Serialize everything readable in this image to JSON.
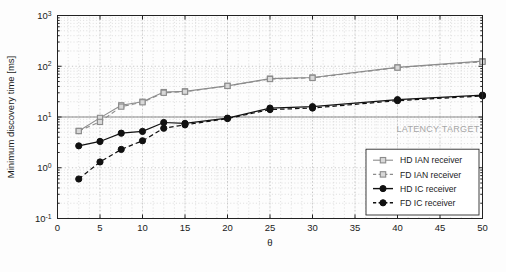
{
  "figure": {
    "background_color": "#fdfdfd",
    "latency_target_label": "LATENCY TARGET",
    "latency_target_value": 10,
    "latency_target_color": "#a6a6a6"
  },
  "chart_data": {
    "type": "line",
    "title": "",
    "xlabel": "θ",
    "ylabel": "Minimum discovery time [ms]",
    "xlim": [
      0,
      50
    ],
    "ylim": [
      0.1,
      1000
    ],
    "yscale": "log",
    "xscale": "linear",
    "grid": true,
    "grid_minor": true,
    "legend_position": "lower right",
    "x_ticks": [
      0,
      5,
      10,
      15,
      20,
      25,
      30,
      35,
      40,
      45,
      50
    ],
    "x_tick_labels": [
      "0",
      "5",
      "10",
      "15",
      "20",
      "25",
      "30",
      "35",
      "40",
      "45",
      "50"
    ],
    "y_ticks": [
      0.1,
      1,
      10,
      100,
      1000
    ],
    "y_tick_labels": [
      "10-1",
      "100",
      "101",
      "102",
      "103"
    ],
    "y_tick_mantissa": [
      "10",
      "10",
      "10",
      "10",
      "10"
    ],
    "y_tick_exponents": [
      "-1",
      "0",
      "1",
      "2",
      "3"
    ],
    "x": [
      2.5,
      5,
      7.5,
      10,
      12.5,
      15,
      20,
      25,
      30,
      40,
      50
    ],
    "series": [
      {
        "name": "HD IAN receiver",
        "color": "#8c8c8c",
        "marker": "square",
        "linestyle": "solid",
        "values": [
          5.3,
          9.6,
          17.0,
          20.0,
          31.0,
          32.0,
          41.0,
          57.0,
          60.0,
          95.0,
          126.0
        ]
      },
      {
        "name": "FD IAN receiver",
        "color": "#8c8c8c",
        "marker": "square",
        "linestyle": "dashed",
        "values": [
          5.3,
          8.0,
          16.0,
          19.5,
          30.0,
          31.5,
          41.0,
          56.0,
          59.0,
          94.0,
          122.0
        ]
      },
      {
        "name": "HD IC receiver",
        "color": "#111111",
        "marker": "circle",
        "linestyle": "solid",
        "values": [
          2.7,
          3.3,
          4.8,
          5.2,
          7.8,
          7.5,
          9.5,
          15.0,
          16.0,
          22.0,
          27.0
        ]
      },
      {
        "name": "FD IC receiver",
        "color": "#111111",
        "marker": "circle",
        "linestyle": "dashed",
        "values": [
          0.6,
          1.3,
          2.3,
          3.4,
          6.0,
          7.0,
          9.3,
          14.0,
          15.0,
          21.0,
          26.0
        ]
      }
    ]
  },
  "legend": {
    "items": [
      {
        "label": "HD IAN receiver"
      },
      {
        "label": "FD IAN receiver"
      },
      {
        "label": "HD IC receiver"
      },
      {
        "label": "FD IC receiver"
      }
    ]
  }
}
